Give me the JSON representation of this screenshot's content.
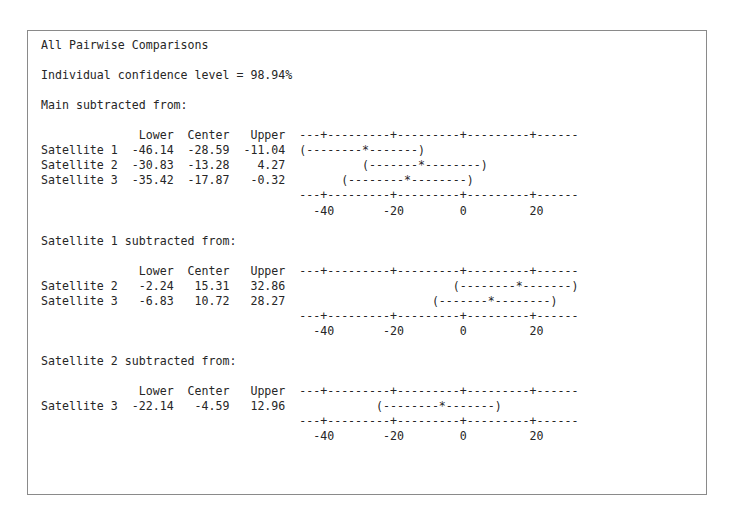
{
  "window": {
    "kind": "statistics-output-pane",
    "border_color": "#8a8a8a",
    "background_color": "#ffffff",
    "text_color": "#262626"
  },
  "report": {
    "title": "All Pairwise Comparisons",
    "confidence_line": "Individual confidence level = 98.94%",
    "confidence_level": 98.94,
    "column_headers": [
      "Lower",
      "Center",
      "Upper"
    ],
    "axis_ticks": [
      "-40",
      "-20",
      "0",
      "20"
    ],
    "axis_rule": "---+---------+---------+---------+------",
    "blocks": [
      {
        "heading": "Main subtracted from:",
        "rows": [
          {
            "label": "Satellite 1",
            "lower": "-46.14",
            "center": "-28.59",
            "upper": "-11.04",
            "interval": "(--------*-------)",
            "indent": 0
          },
          {
            "label": "Satellite 2",
            "lower": "-30.83",
            "center": "-13.28",
            "upper": "4.27",
            "interval": "(-------*--------)",
            "indent": 9
          },
          {
            "label": "Satellite 3",
            "lower": "-35.42",
            "center": "-17.87",
            "upper": "-0.32",
            "interval": "(--------*--------)",
            "indent": 6
          }
        ]
      },
      {
        "heading": "Satellite 1 subtracted from:",
        "rows": [
          {
            "label": "Satellite 2",
            "lower": "-2.24",
            "center": "15.31",
            "upper": "32.86",
            "interval": "(--------*-------)",
            "indent": 22
          },
          {
            "label": "Satellite 3",
            "lower": "-6.83",
            "center": "10.72",
            "upper": "28.27",
            "interval": "(-------*--------)",
            "indent": 19
          }
        ]
      },
      {
        "heading": "Satellite 2 subtracted from:",
        "rows": [
          {
            "label": "Satellite 3",
            "lower": "-22.14",
            "center": "-4.59",
            "upper": "12.96",
            "interval": "(--------*-------)",
            "indent": 11
          }
        ]
      }
    ]
  },
  "chart_data": {
    "type": "table",
    "title": "All Pairwise Comparisons",
    "subtitle": "Individual confidence level = 98.94%",
    "xlabel": "",
    "ylabel": "",
    "xlim": [
      -40,
      20
    ],
    "xticks": [
      -40,
      -20,
      0,
      20
    ],
    "grid": false,
    "columns": [
      "Comparison",
      "Lower",
      "Center",
      "Upper"
    ],
    "groups": [
      {
        "name": "Main subtracted from:",
        "rows": [
          {
            "comparison": "Satellite 1",
            "lower": -46.14,
            "center": -28.59,
            "upper": -11.04
          },
          {
            "comparison": "Satellite 2",
            "lower": -30.83,
            "center": -13.28,
            "upper": 4.27
          },
          {
            "comparison": "Satellite 3",
            "lower": -35.42,
            "center": -17.87,
            "upper": -0.32
          }
        ]
      },
      {
        "name": "Satellite 1 subtracted from:",
        "rows": [
          {
            "comparison": "Satellite 2",
            "lower": -2.24,
            "center": 15.31,
            "upper": 32.86
          },
          {
            "comparison": "Satellite 3",
            "lower": -6.83,
            "center": 10.72,
            "upper": 28.27
          }
        ]
      },
      {
        "name": "Satellite 2 subtracted from:",
        "rows": [
          {
            "comparison": "Satellite 3",
            "lower": -22.14,
            "center": -4.59,
            "upper": 12.96
          }
        ]
      }
    ]
  }
}
